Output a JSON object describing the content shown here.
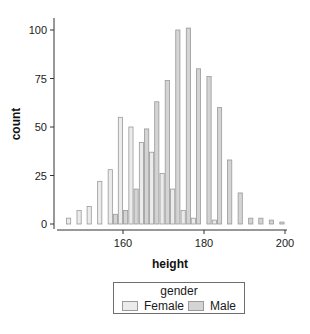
{
  "chart_data": {
    "type": "bar",
    "subtype": "histogram-dodged",
    "title": "",
    "xlabel": "height",
    "ylabel": "count",
    "x_ticks": [
      160,
      180,
      200
    ],
    "y_ticks": [
      0,
      25,
      50,
      75,
      100
    ],
    "xlim": [
      144.5,
      201
    ],
    "ylim": [
      -2,
      106
    ],
    "grid": false,
    "bin_width": 2.57,
    "bin_centers": [
      147.2,
      149.8,
      152.3,
      154.9,
      157.5,
      160.0,
      162.6,
      165.2,
      167.7,
      170.3,
      172.9,
      175.5,
      178.0,
      180.6,
      183.2,
      185.7,
      188.3,
      190.9,
      193.4,
      196.0,
      198.6
    ],
    "series": [
      {
        "name": "Female",
        "color": "#ebebeb",
        "values": [
          3,
          7,
          9,
          22,
          28,
          55,
          50,
          42,
          37,
          26,
          18,
          7,
          3,
          0,
          2,
          0,
          0,
          0,
          0,
          0,
          0
        ]
      },
      {
        "name": "Male",
        "color": "#d4d4d4",
        "values": [
          0,
          0,
          0,
          0,
          5,
          7,
          18,
          49,
          63,
          74,
          100,
          101,
          80,
          76,
          60,
          33,
          16,
          3,
          3,
          2,
          1
        ]
      }
    ],
    "legend": {
      "title": "gender",
      "position": "bottom",
      "entries": [
        "Female",
        "Male"
      ]
    },
    "outline_color": "#9a9a9a"
  },
  "legend": {
    "title": "gender",
    "items": [
      {
        "label": "Female",
        "color": "#ebebeb"
      },
      {
        "label": "Male",
        "color": "#d4d4d4"
      }
    ]
  }
}
